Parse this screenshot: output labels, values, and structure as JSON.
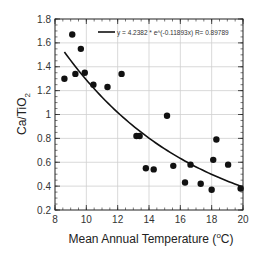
{
  "chart_data": {
    "type": "scatter",
    "title": "",
    "xlabel": "Mean Annual Temperature (°C)",
    "xlabel_parts": {
      "pre": "Mean Annual Temperature (",
      "sup": "o",
      "post": "C)"
    },
    "ylabel": "Ca/TiO2",
    "ylabel_parts": {
      "main": "Ca/TiO",
      "sub": "2"
    },
    "xlim": [
      8,
      20
    ],
    "ylim": [
      0.2,
      1.8
    ],
    "xticks": [
      8,
      10,
      12,
      14,
      16,
      18,
      20
    ],
    "xtick_labels": [
      "8",
      "10",
      "12",
      "14",
      "16",
      "18",
      "20"
    ],
    "yticks": [
      0.2,
      0.4,
      0.6,
      0.8,
      1.0,
      1.2,
      1.4,
      1.6,
      1.8
    ],
    "ytick_labels": [
      "0.2",
      "0.4",
      "0.6",
      "0.8",
      "1",
      "1.2",
      "1.4",
      "1.6",
      "1.8"
    ],
    "grid": true,
    "legend_position": "top-right",
    "series": [
      {
        "name": "observations",
        "kind": "scatter",
        "color": "#111111",
        "points": [
          [
            8.6,
            1.3
          ],
          [
            9.1,
            1.67
          ],
          [
            9.3,
            1.34
          ],
          [
            9.65,
            1.55
          ],
          [
            9.9,
            1.35
          ],
          [
            10.45,
            1.25
          ],
          [
            11.35,
            1.23
          ],
          [
            12.25,
            1.34
          ],
          [
            13.2,
            0.82
          ],
          [
            13.4,
            0.82
          ],
          [
            13.8,
            0.55
          ],
          [
            14.3,
            0.54
          ],
          [
            15.15,
            0.99
          ],
          [
            15.55,
            0.57
          ],
          [
            16.3,
            0.43
          ],
          [
            16.65,
            0.58
          ],
          [
            17.3,
            0.42
          ],
          [
            18.0,
            0.37
          ],
          [
            18.1,
            0.62
          ],
          [
            18.3,
            0.79
          ],
          [
            19.05,
            0.58
          ],
          [
            19.85,
            0.38
          ]
        ]
      },
      {
        "name": "y = 4.2382 * e^(-0.11893x)   R= 0.89789",
        "kind": "fit-line",
        "color": "#111111",
        "a": 4.2382,
        "b": -0.11893,
        "x_range": [
          8.6,
          19.85
        ],
        "R": 0.89789
      }
    ],
    "legend": [
      {
        "label": "y = 4.2382 * e^(-0.11893x)   R= 0.89789",
        "symbol": "line"
      }
    ]
  }
}
